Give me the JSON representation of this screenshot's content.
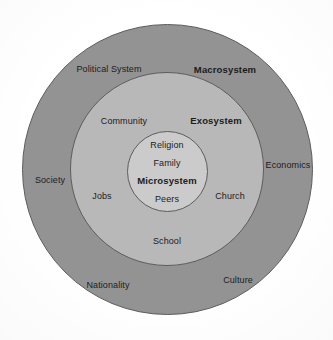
{
  "diagram": {
    "background_color": "#ffffff",
    "rings": [
      {
        "key": "macrosystem",
        "label": "Macrosystem",
        "fill": "#939393",
        "stroke": "#5d5d5d",
        "order": 1
      },
      {
        "key": "exosystem",
        "label": "Exosystem",
        "fill": "#b8b8b8",
        "stroke": "#5d5d5d",
        "order": 2
      },
      {
        "key": "microsystem",
        "label": "Microsystem",
        "fill": "#cbcbcb",
        "stroke": "#5d5d5d",
        "order": 3
      }
    ],
    "labels": {
      "macrosystem": {
        "system": "Macrosystem",
        "items": [
          "Political System",
          "Society",
          "Economics",
          "Nationality",
          "Culture"
        ]
      },
      "exosystem": {
        "system": "Exosystem",
        "items": [
          "Community",
          "Jobs",
          "Church",
          "School"
        ]
      },
      "microsystem": {
        "system": "Microsystem",
        "items": [
          "Religion",
          "Family",
          "Peers"
        ]
      }
    }
  }
}
